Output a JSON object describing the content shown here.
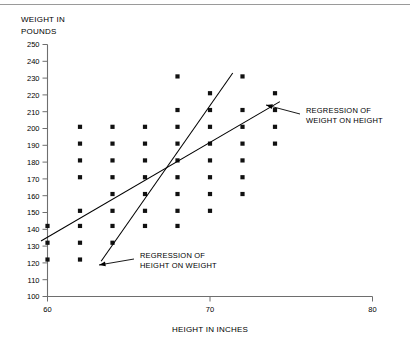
{
  "chart_data": {
    "type": "scatter",
    "title": "",
    "xlabel": "HEIGHT IN INCHES",
    "ylabel": "WEIGHT IN POUNDS",
    "ylabel_lines": [
      "WEIGHT IN",
      "POUNDS"
    ],
    "xlim": [
      60,
      80
    ],
    "ylim": [
      100,
      250
    ],
    "xticks": [
      60,
      70,
      80
    ],
    "xtick_labels": [
      "60",
      "70",
      "80"
    ],
    "yticks": [
      100,
      110,
      120,
      130,
      140,
      150,
      160,
      170,
      180,
      190,
      200,
      210,
      220,
      230,
      240,
      250
    ],
    "ytick_labels": [
      "100",
      "110",
      "120",
      "130",
      "140",
      "150",
      "160",
      "170",
      "180",
      "190",
      "200",
      "210",
      "220",
      "230",
      "240",
      "250"
    ],
    "grid": false,
    "legend": "none",
    "marker_shape": "square",
    "marker_color": "#111111",
    "points": [
      {
        "x": 60,
        "y": 142
      },
      {
        "x": 60,
        "y": 132
      },
      {
        "x": 60,
        "y": 122
      },
      {
        "x": 62,
        "y": 201
      },
      {
        "x": 62,
        "y": 191
      },
      {
        "x": 62,
        "y": 181
      },
      {
        "x": 62,
        "y": 171
      },
      {
        "x": 62,
        "y": 151
      },
      {
        "x": 62,
        "y": 142
      },
      {
        "x": 62,
        "y": 132
      },
      {
        "x": 62,
        "y": 122
      },
      {
        "x": 64,
        "y": 201
      },
      {
        "x": 64,
        "y": 191
      },
      {
        "x": 64,
        "y": 181
      },
      {
        "x": 64,
        "y": 171
      },
      {
        "x": 64,
        "y": 161
      },
      {
        "x": 64,
        "y": 151
      },
      {
        "x": 64,
        "y": 142
      },
      {
        "x": 64,
        "y": 132
      },
      {
        "x": 66,
        "y": 201
      },
      {
        "x": 66,
        "y": 191
      },
      {
        "x": 66,
        "y": 181
      },
      {
        "x": 66,
        "y": 171
      },
      {
        "x": 66,
        "y": 161
      },
      {
        "x": 66,
        "y": 151
      },
      {
        "x": 66,
        "y": 142
      },
      {
        "x": 68,
        "y": 231
      },
      {
        "x": 68,
        "y": 211
      },
      {
        "x": 68,
        "y": 201
      },
      {
        "x": 68,
        "y": 191
      },
      {
        "x": 68,
        "y": 181
      },
      {
        "x": 68,
        "y": 171
      },
      {
        "x": 68,
        "y": 161
      },
      {
        "x": 68,
        "y": 151
      },
      {
        "x": 68,
        "y": 142
      },
      {
        "x": 70,
        "y": 221
      },
      {
        "x": 70,
        "y": 211
      },
      {
        "x": 70,
        "y": 201
      },
      {
        "x": 70,
        "y": 191
      },
      {
        "x": 70,
        "y": 181
      },
      {
        "x": 70,
        "y": 171
      },
      {
        "x": 70,
        "y": 161
      },
      {
        "x": 70,
        "y": 151
      },
      {
        "x": 72,
        "y": 231
      },
      {
        "x": 72,
        "y": 211
      },
      {
        "x": 72,
        "y": 201
      },
      {
        "x": 72,
        "y": 191
      },
      {
        "x": 72,
        "y": 181
      },
      {
        "x": 72,
        "y": 171
      },
      {
        "x": 72,
        "y": 161
      },
      {
        "x": 74,
        "y": 221
      },
      {
        "x": 74,
        "y": 211
      },
      {
        "x": 74,
        "y": 201
      },
      {
        "x": 74,
        "y": 191
      }
    ],
    "lines": [
      {
        "name": "regression of weight on height",
        "label": "REGRESSION OF WEIGHT ON HEIGHT",
        "x_start": 59.6,
        "y_start": 133,
        "x_end": 74.3,
        "y_end": 216
      },
      {
        "name": "regression of height on weight",
        "label": "REGRESSION OF HEIGHT ON WEIGHT",
        "x_start": 63.3,
        "y_start": 121,
        "x_end": 71.4,
        "y_end": 233
      }
    ],
    "annotations": [
      {
        "name": "regression-weight-on-height",
        "lines": [
          "REGRESSION OF",
          "WEIGHT ON HEIGHT"
        ],
        "text_x": 306,
        "text_y": 113,
        "leader_from_x": 300,
        "leader_from_y": 114,
        "leader_to_x": 266,
        "leader_to_y": 105
      },
      {
        "name": "regression-height-on-weight",
        "lines": [
          "REGRESSION OF",
          "HEIGHT ON WEIGHT"
        ],
        "text_x": 140,
        "text_y": 258,
        "leader_from_x": 134,
        "leader_from_y": 259,
        "leader_to_x": 99,
        "leader_to_y": 265
      }
    ]
  },
  "colors": {
    "marker": "#111111",
    "frame": "#6e6e6e",
    "line": "#000000",
    "background": "#ffffff"
  }
}
